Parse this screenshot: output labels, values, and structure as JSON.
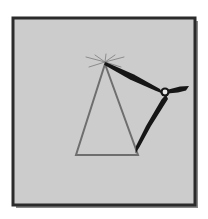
{
  "figure": {
    "canvas": {
      "width": 208,
      "height": 219
    },
    "background_color": "#ffffff",
    "panel": {
      "x": 13,
      "y": 18,
      "width": 182,
      "height": 187,
      "fill_color": "#cccccc",
      "border_color": "#2b2b2b",
      "border_width": 3,
      "shadow_color": "#8a8a8a"
    },
    "shapes": {
      "triangle": {
        "label": "triangle outline",
        "stroke_color": "#6e6e6e",
        "stroke_width": 2,
        "fill": "none",
        "apex": {
          "x": 105,
          "y": 64
        },
        "bottom_left": {
          "x": 76,
          "y": 155
        },
        "bottom_right": {
          "x": 138,
          "y": 155
        }
      },
      "apex_fan_lines": {
        "label": "thin crossing lines at apex",
        "stroke_color": "#8c8c8c",
        "stroke_width": 1,
        "center": {
          "x": 105,
          "y": 62
        },
        "endpoints": [
          {
            "x": 88,
            "y": 58
          },
          {
            "x": 122,
            "y": 58
          },
          {
            "x": 90,
            "y": 66
          },
          {
            "x": 120,
            "y": 66
          },
          {
            "x": 96,
            "y": 56
          },
          {
            "x": 114,
            "y": 57
          }
        ]
      },
      "upper_arm": {
        "label": "upper hinged arm",
        "fill_color": "#161616",
        "from": {
          "x": 105,
          "y": 63
        },
        "to": {
          "x": 162,
          "y": 92
        },
        "max_thickness": 6
      },
      "lower_arm": {
        "label": "lower hinged arm",
        "fill_color": "#161616",
        "from": {
          "x": 164,
          "y": 95
        },
        "to": {
          "x": 137,
          "y": 152
        },
        "max_thickness": 5
      },
      "right_tail": {
        "label": "short tail right of pivot",
        "fill_color": "#161616",
        "from": {
          "x": 166,
          "y": 92
        },
        "to": {
          "x": 188,
          "y": 88
        },
        "max_thickness": 5
      },
      "pivot": {
        "label": "pivot joint hole",
        "center": {
          "x": 165,
          "y": 92
        },
        "radius": 2.4,
        "hole_color": "#e8e8e8",
        "ring_color": "#161616"
      }
    }
  }
}
